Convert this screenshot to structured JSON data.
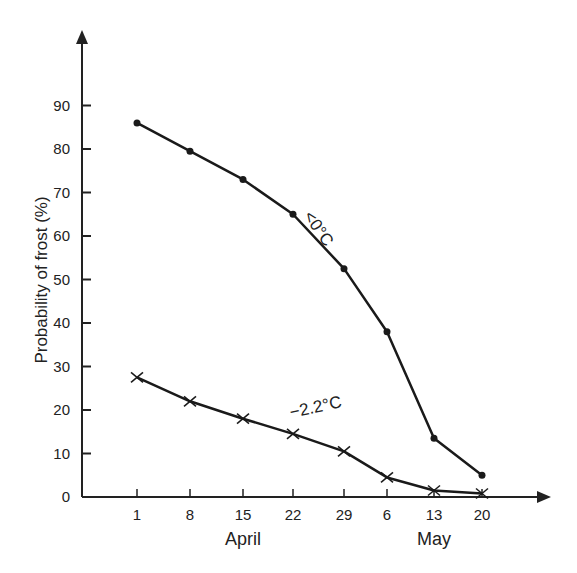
{
  "chart_data": {
    "type": "line",
    "title": "",
    "xlabel": "",
    "ylabel": "Probability of frost (%)",
    "ylim": [
      0,
      100
    ],
    "yticks": [
      0,
      10,
      20,
      30,
      40,
      50,
      60,
      70,
      80,
      90
    ],
    "categories": [
      "1",
      "8",
      "15",
      "22",
      "29",
      "6",
      "13",
      "20"
    ],
    "month_labels": [
      {
        "label": "April",
        "under_category": "15"
      },
      {
        "label": "May",
        "under_category": "13"
      }
    ],
    "grid": false,
    "legend": "inline labels",
    "series": [
      {
        "name": "<0°C",
        "marker": "dot",
        "values": [
          86,
          79.5,
          73,
          65,
          52.5,
          38,
          13.5,
          5
        ]
      },
      {
        "name": "−2.2°C",
        "marker": "x",
        "values": [
          27.5,
          22,
          18,
          14.5,
          10.5,
          4.5,
          1.5,
          0.8
        ]
      }
    ]
  },
  "axis": {
    "ylabel": "Probability of frost (%)",
    "yticks": [
      "0",
      "10",
      "20",
      "30",
      "40",
      "50",
      "60",
      "70",
      "80",
      "90"
    ],
    "xticks": [
      "1",
      "8",
      "15",
      "22",
      "29",
      "6",
      "13",
      "20"
    ],
    "months": [
      "April",
      "May"
    ]
  },
  "labels": {
    "series0": "<0°C",
    "series1": "−2.2°C"
  }
}
